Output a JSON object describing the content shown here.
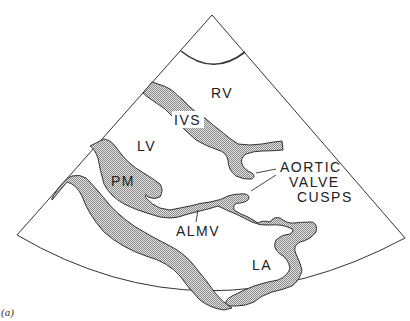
{
  "figure": {
    "caption_label": "(a)",
    "view": "parasternal long-axis echocardiogram sector",
    "fill_color": "#bdbdbd",
    "line_color": "#333333"
  },
  "labels": {
    "rv": "RV",
    "ivs": "IVS",
    "lv": "LV",
    "pm": "PM",
    "aortic_valve_cusps": [
      "AORTIC",
      "VALVE",
      "CUSPS"
    ],
    "almv": "ALMV",
    "la": "LA"
  }
}
